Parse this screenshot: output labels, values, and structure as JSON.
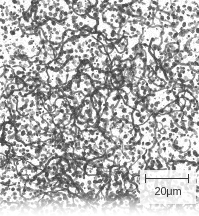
{
  "figure": {
    "kind": "micrograph",
    "modality": "grayscale reflected-light metallographic micrograph",
    "background_color": "#fdfdfd",
    "feature_color": "#4a4a4a",
    "width_px": 199,
    "height_px": 216
  },
  "scale_bar": {
    "label": "20μm",
    "value": 20,
    "unit": "μm",
    "bar_length_px": 44,
    "style": "i-beam",
    "color": "#3a3a3a",
    "position": "bottom-right"
  },
  "chart_data": {
    "type": "heatmap",
    "title": "",
    "xlabel": "",
    "ylabel": "",
    "field": {
      "width_px": 199,
      "height_px": 216,
      "phase_dark_fraction": 0.33,
      "particle_mean_diameter_px": 2.6,
      "network_strand_width_px": 1.8
    },
    "calibration": {
      "scale_bar_label": "20μm",
      "scale_bar_value": 20,
      "scale_bar_unit": "μm",
      "scale_bar_length_px": 44,
      "microns_per_px": 0.4545,
      "field_width_um": 90.5,
      "field_height_um": 98.2
    },
    "density_map": {
      "note": "relative areal fraction of the dark phase by region, rows top to bottom",
      "rows": [
        "top",
        "upper-middle",
        "middle",
        "lower-middle",
        "bottom"
      ],
      "cols": [
        "left",
        "center",
        "right"
      ],
      "values": [
        [
          0.34,
          0.3,
          0.28
        ],
        [
          0.36,
          0.33,
          0.3
        ],
        [
          0.38,
          0.34,
          0.31
        ],
        [
          0.4,
          0.36,
          0.3
        ],
        [
          0.42,
          0.38,
          0.26
        ]
      ]
    }
  }
}
